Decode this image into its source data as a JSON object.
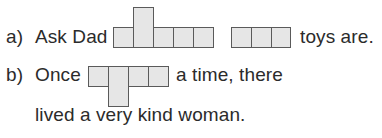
{
  "exercise": {
    "items": [
      {
        "label": "a)",
        "segments": [
          "Ask Dad",
          "toys are."
        ],
        "word_shapes": [
          {
            "letters": 5,
            "tall_letter_index": 1,
            "tall_direction": "up"
          },
          {
            "letters": 3,
            "tall_letter_index": null,
            "tall_direction": null
          }
        ]
      },
      {
        "label": "b)",
        "segments": [
          "Once",
          "a time, there",
          "lived a very kind woman."
        ],
        "word_shapes": [
          {
            "letters": 4,
            "tall_letter_index": 1,
            "tall_direction": "down"
          }
        ]
      }
    ],
    "colors": {
      "text": "#2b2b2b",
      "box_fill": "#e6e6e6",
      "box_border": "#5a5a5a"
    }
  }
}
